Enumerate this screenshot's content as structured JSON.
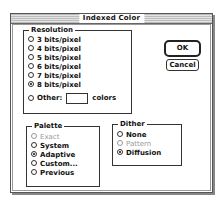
{
  "window": {
    "title": "Indexed Color"
  },
  "buttons": {
    "ok": "OK",
    "cancel": "Cancel"
  },
  "resolution": {
    "label": "Resolution",
    "options": [
      {
        "label": "3 bits/pixel",
        "selected": false
      },
      {
        "label": "4 bits/pixel",
        "selected": false
      },
      {
        "label": "5 bits/pixel",
        "selected": false
      },
      {
        "label": "6 bits/pixel",
        "selected": false
      },
      {
        "label": "7 bits/pixel",
        "selected": false
      },
      {
        "label": "8 bits/pixel",
        "selected": true
      }
    ],
    "other": {
      "label": "Other:",
      "value": "",
      "suffix": "colors",
      "selected": false
    }
  },
  "palette": {
    "label": "Palette",
    "options": [
      {
        "label": "Exact",
        "selected": false,
        "disabled": true
      },
      {
        "label": "System",
        "selected": false,
        "disabled": false
      },
      {
        "label": "Adaptive",
        "selected": true,
        "disabled": false
      },
      {
        "label": "Custom...",
        "selected": false,
        "disabled": false
      },
      {
        "label": "Previous",
        "selected": false,
        "disabled": false
      }
    ]
  },
  "dither": {
    "label": "Dither",
    "options": [
      {
        "label": "None",
        "selected": false,
        "disabled": false
      },
      {
        "label": "Pattern",
        "selected": false,
        "disabled": true
      },
      {
        "label": "Diffusion",
        "selected": true,
        "disabled": false
      }
    ]
  }
}
